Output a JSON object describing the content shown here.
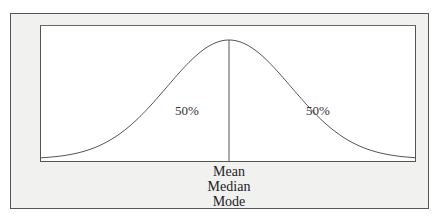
{
  "diagram": {
    "type": "normal-distribution",
    "left_area_label": "50%",
    "right_area_label": "50%",
    "center_labels": [
      "Mean",
      "Median",
      "Mode"
    ],
    "colors": {
      "frame_fill": "#f1f1f0",
      "plot_fill": "#ffffff",
      "line": "#555555",
      "text": "#222222"
    }
  },
  "chart_data": {
    "type": "line",
    "title": "",
    "xlabel": "",
    "ylabel": "",
    "series": [
      {
        "name": "normal curve",
        "x": [
          -3,
          -2.5,
          -2,
          -1.5,
          -1,
          -0.5,
          0,
          0.5,
          1,
          1.5,
          2,
          2.5,
          3
        ],
        "y": [
          0.004,
          0.018,
          0.054,
          0.13,
          0.242,
          0.352,
          0.399,
          0.352,
          0.242,
          0.13,
          0.054,
          0.018,
          0.004
        ]
      }
    ],
    "annotations": [
      {
        "text": "50%",
        "position": "left of center"
      },
      {
        "text": "50%",
        "position": "right of center"
      },
      {
        "text": "Mean / Median / Mode",
        "position": "below center line"
      }
    ],
    "grid": false
  }
}
